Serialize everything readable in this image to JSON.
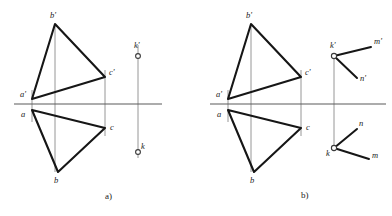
{
  "figure": {
    "background_color": "#ffffff",
    "line_color": "#161616",
    "axis_color": "#5b5b5b",
    "construction_color": "#8a8a8a",
    "width": 392,
    "height": 216
  },
  "panels": [
    {
      "id": "panel-a",
      "caption": "a)",
      "caption_pos": {
        "x": 105,
        "y": 199
      },
      "origin_x": 0,
      "ground_line": {
        "x1": 14,
        "y1": 104,
        "x2": 162,
        "y2": 104
      },
      "vertices": [
        {
          "name": "b-prime",
          "label": "b'",
          "x": 55,
          "y": 24,
          "label_x": 50,
          "label_y": 18
        },
        {
          "name": "a-prime",
          "label": "a'",
          "x": 32,
          "y": 99,
          "label_x": 20,
          "label_y": 97
        },
        {
          "name": "c-prime",
          "label": "c'",
          "x": 105,
          "y": 77,
          "label_x": 109,
          "label_y": 75
        },
        {
          "name": "a",
          "label": "a",
          "x": 32,
          "y": 110,
          "label_x": 21,
          "label_y": 117
        },
        {
          "name": "c",
          "label": "c",
          "x": 105,
          "y": 128,
          "label_x": 110,
          "label_y": 130
        },
        {
          "name": "b",
          "label": "b",
          "x": 58,
          "y": 172,
          "label_x": 54,
          "label_y": 183
        }
      ],
      "upper_triangle": [
        [
          55,
          24
        ],
        [
          32,
          99
        ],
        [
          105,
          77
        ]
      ],
      "lower_triangle": [
        [
          32,
          110
        ],
        [
          58,
          172
        ],
        [
          105,
          128
        ]
      ],
      "construction_lines": [
        {
          "x1": 32,
          "y1": 90,
          "x2": 32,
          "y2": 122
        },
        {
          "x1": 55,
          "y1": 24,
          "x2": 55,
          "y2": 172
        },
        {
          "x1": 105,
          "y1": 70,
          "x2": 105,
          "y2": 136
        },
        {
          "x1": 138,
          "y1": 45,
          "x2": 138,
          "y2": 158
        }
      ],
      "points": [
        {
          "name": "k-prime-point",
          "label": "k'",
          "x": 138,
          "y": 56,
          "r": 2.4,
          "label_x": 134,
          "label_y": 48
        },
        {
          "name": "k-point",
          "label": "k",
          "x": 138,
          "y": 152,
          "r": 2.4,
          "label_x": 141,
          "label_y": 149
        }
      ],
      "rays": []
    },
    {
      "id": "panel-b",
      "caption": "b)",
      "caption_pos": {
        "x": 301,
        "y": 198
      },
      "origin_x": 196,
      "ground_line": {
        "x1": 210,
        "y1": 104,
        "x2": 386,
        "y2": 104
      },
      "vertices": [
        {
          "name": "b-prime",
          "label": "b'",
          "x": 251,
          "y": 24,
          "label_x": 246,
          "label_y": 18
        },
        {
          "name": "a-prime",
          "label": "a'",
          "x": 228,
          "y": 99,
          "label_x": 216,
          "label_y": 97
        },
        {
          "name": "c-prime",
          "label": "c'",
          "x": 301,
          "y": 77,
          "label_x": 305,
          "label_y": 75
        },
        {
          "name": "a",
          "label": "a",
          "x": 228,
          "y": 110,
          "label_x": 217,
          "label_y": 117
        },
        {
          "name": "c",
          "label": "c",
          "x": 301,
          "y": 128,
          "label_x": 306,
          "label_y": 130
        },
        {
          "name": "b",
          "label": "b",
          "x": 254,
          "y": 172,
          "label_x": 250,
          "label_y": 183
        }
      ],
      "upper_triangle": [
        [
          251,
          24
        ],
        [
          228,
          99
        ],
        [
          301,
          77
        ]
      ],
      "lower_triangle": [
        [
          228,
          110
        ],
        [
          254,
          172
        ],
        [
          301,
          128
        ]
      ],
      "construction_lines": [
        {
          "x1": 228,
          "y1": 90,
          "x2": 228,
          "y2": 122
        },
        {
          "x1": 251,
          "y1": 24,
          "x2": 251,
          "y2": 172
        },
        {
          "x1": 301,
          "y1": 70,
          "x2": 301,
          "y2": 136
        },
        {
          "x1": 334,
          "y1": 56,
          "x2": 334,
          "y2": 148
        }
      ],
      "points": [
        {
          "name": "k-prime-point",
          "label": "k'",
          "x": 334,
          "y": 56,
          "r": 2.6,
          "label_x": 330,
          "label_y": 48
        },
        {
          "name": "k-point",
          "label": "k",
          "x": 334,
          "y": 148,
          "r": 2.6,
          "label_x": 326,
          "label_y": 156
        }
      ],
      "rays": [
        {
          "name": "ray-k-prime-m-prime",
          "x1": 334,
          "y1": 56,
          "x2": 371,
          "y2": 47,
          "end_label": "m'",
          "label_x": 374,
          "label_y": 44
        },
        {
          "name": "ray-k-prime-n-prime",
          "x1": 334,
          "y1": 56,
          "x2": 357,
          "y2": 78,
          "end_label": "n'",
          "label_x": 360,
          "label_y": 81
        },
        {
          "name": "ray-k-n",
          "x1": 334,
          "y1": 148,
          "x2": 357,
          "y2": 129,
          "end_label": "n",
          "label_x": 359,
          "label_y": 126
        },
        {
          "name": "ray-k-m",
          "x1": 334,
          "y1": 148,
          "x2": 369,
          "y2": 159,
          "end_label": "m",
          "label_x": 372,
          "label_y": 158
        }
      ]
    }
  ]
}
